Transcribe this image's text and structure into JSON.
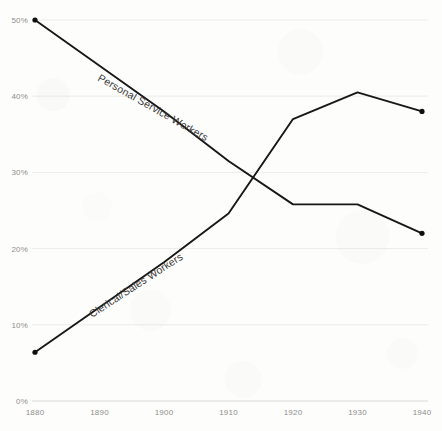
{
  "chart_data": {
    "type": "line",
    "title": "",
    "subtitle": "",
    "xlabel": "",
    "ylabel": "",
    "x": [
      1880,
      1890,
      1900,
      1910,
      1920,
      1930,
      1940
    ],
    "xlim": [
      1880,
      1940
    ],
    "ylim": [
      0,
      50
    ],
    "x_tick_labels": [
      "1880",
      "1890",
      "1900",
      "1910",
      "1920",
      "1930",
      "1940"
    ],
    "y_tick_values": [
      0,
      10,
      20,
      30,
      40,
      50
    ],
    "y_tick_labels": [
      "0%",
      "10%",
      "20%",
      "30%",
      "40%",
      "50%"
    ],
    "grid": true,
    "grid_axis": "y",
    "legend": "inline-labels",
    "legend_position": "along-lines",
    "line_color": "#171717",
    "grid_color": "#ececea",
    "tick_label_color": "#8d8d8d",
    "background_color": "#fdfdfb",
    "series": [
      {
        "name": "Personal Service Workers",
        "label": "Personal Service Workers",
        "values": [
          50.0,
          44.0,
          38.0,
          31.5,
          25.8,
          25.8,
          22.0
        ],
        "label_angle_deg": 29.5,
        "label_x_px": 97,
        "label_y_px": 80,
        "endpoint_markers": [
          {
            "x": 1880,
            "y": 50.0
          },
          {
            "x": 1940,
            "y": 22.0
          }
        ]
      },
      {
        "name": "Clerical/Sales Workers",
        "label": "Clerical/Sales Workers",
        "values": [
          6.4,
          12.3,
          18.2,
          24.6,
          37.0,
          40.5,
          38.0
        ],
        "label_angle_deg": -33.0,
        "label_x_px": 92,
        "label_y_px": 318,
        "endpoint_markers": [
          {
            "x": 1880,
            "y": 6.4
          },
          {
            "x": 1940,
            "y": 38.0
          }
        ]
      }
    ],
    "annotations": [
      {
        "text": "crossover",
        "x": 1917,
        "y": 27.7,
        "visible": false
      }
    ]
  }
}
